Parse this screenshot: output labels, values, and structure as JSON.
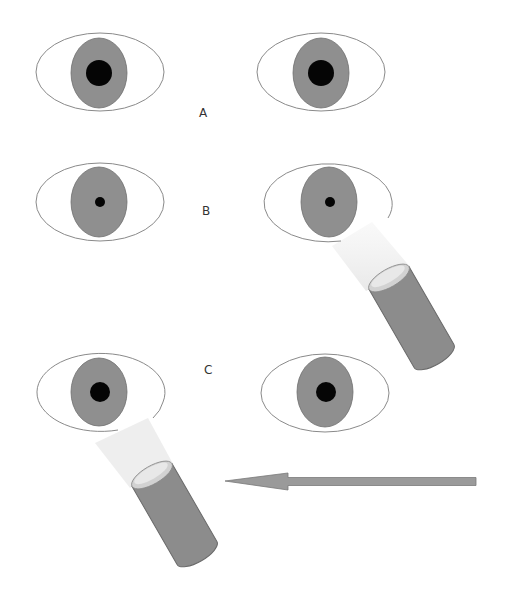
{
  "labels": {
    "a": "A",
    "b": "B",
    "c": "C"
  },
  "colors": {
    "sclera": "#ffffff",
    "sclera_stroke": "#8a8a8a",
    "iris": "#8f8f8f",
    "iris_stroke": "#6e6e6e",
    "pupil": "#050505",
    "flashlight_body": "#8c8c8c",
    "flashlight_stroke": "#6a6a6a",
    "flashlight_lens": "#d2d2d2",
    "beam": "#ececec",
    "arrow": "#9a9a9a",
    "arrow_stroke": "#7a7a7a"
  },
  "rows": [
    {
      "id": "A",
      "pupil_state": "normal",
      "flashlight": "none"
    },
    {
      "id": "B",
      "pupil_state": "constricted",
      "flashlight": "right-eye"
    },
    {
      "id": "C",
      "pupil_state": "normal",
      "flashlight": "left-eye"
    }
  ],
  "arrow": {
    "direction": "left"
  }
}
